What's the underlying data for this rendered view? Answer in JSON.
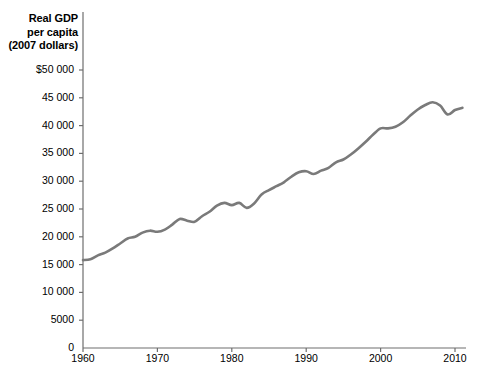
{
  "chart_data": {
    "type": "line",
    "title": "",
    "ylabel_lines": [
      "Real GDP",
      "per capita",
      "(2007 dollars)"
    ],
    "ylabel": "Real GDP per capita (2007 dollars)",
    "xlabel": "",
    "xlim": [
      1960,
      2011
    ],
    "ylim": [
      0,
      50000
    ],
    "grid": false,
    "legend": "none",
    "line_color": "#7a7a7a",
    "axis_color": "#6e6e6e",
    "yticks": [
      0,
      5000,
      10000,
      15000,
      20000,
      25000,
      30000,
      35000,
      40000,
      45000,
      50000
    ],
    "ytick_labels": [
      "0",
      "5000",
      "10 000",
      "15 000",
      "20 000",
      "25 000",
      "30 000",
      "35 000",
      "40 000",
      "45 000",
      "$50 000"
    ],
    "xticks": [
      1960,
      1970,
      1980,
      1990,
      2000,
      2010
    ],
    "xtick_labels": [
      "1960",
      "1970",
      "1980",
      "1990",
      "2000",
      "2010"
    ],
    "series": [
      {
        "name": "Real GDP per capita (2007 dollars)",
        "x": [
          1960,
          1961,
          1962,
          1963,
          1964,
          1965,
          1966,
          1967,
          1968,
          1969,
          1970,
          1971,
          1972,
          1973,
          1974,
          1975,
          1976,
          1977,
          1978,
          1979,
          1980,
          1981,
          1982,
          1983,
          1984,
          1985,
          1986,
          1987,
          1988,
          1989,
          1990,
          1991,
          1992,
          1993,
          1994,
          1995,
          1996,
          1997,
          1998,
          1999,
          2000,
          2001,
          2002,
          2003,
          2004,
          2005,
          2006,
          2007,
          2008,
          2009,
          2010,
          2011
        ],
        "values": [
          15800,
          15950,
          16650,
          17150,
          17900,
          18800,
          19700,
          20000,
          20750,
          21100,
          20900,
          21300,
          22200,
          23200,
          22900,
          22700,
          23700,
          24500,
          25600,
          26100,
          25700,
          26100,
          25200,
          26000,
          27600,
          28400,
          29100,
          29800,
          30800,
          31600,
          31800,
          31300,
          31900,
          32400,
          33400,
          33900,
          34800,
          35900,
          37100,
          38400,
          39500,
          39500,
          39800,
          40600,
          41800,
          42900,
          43700,
          44200,
          43600,
          42000,
          42800,
          43200
        ]
      }
    ]
  },
  "plot_geometry": {
    "x_left_px": 83,
    "x_right_px": 462,
    "y_zero_px": 348,
    "y_top_px": 70
  }
}
